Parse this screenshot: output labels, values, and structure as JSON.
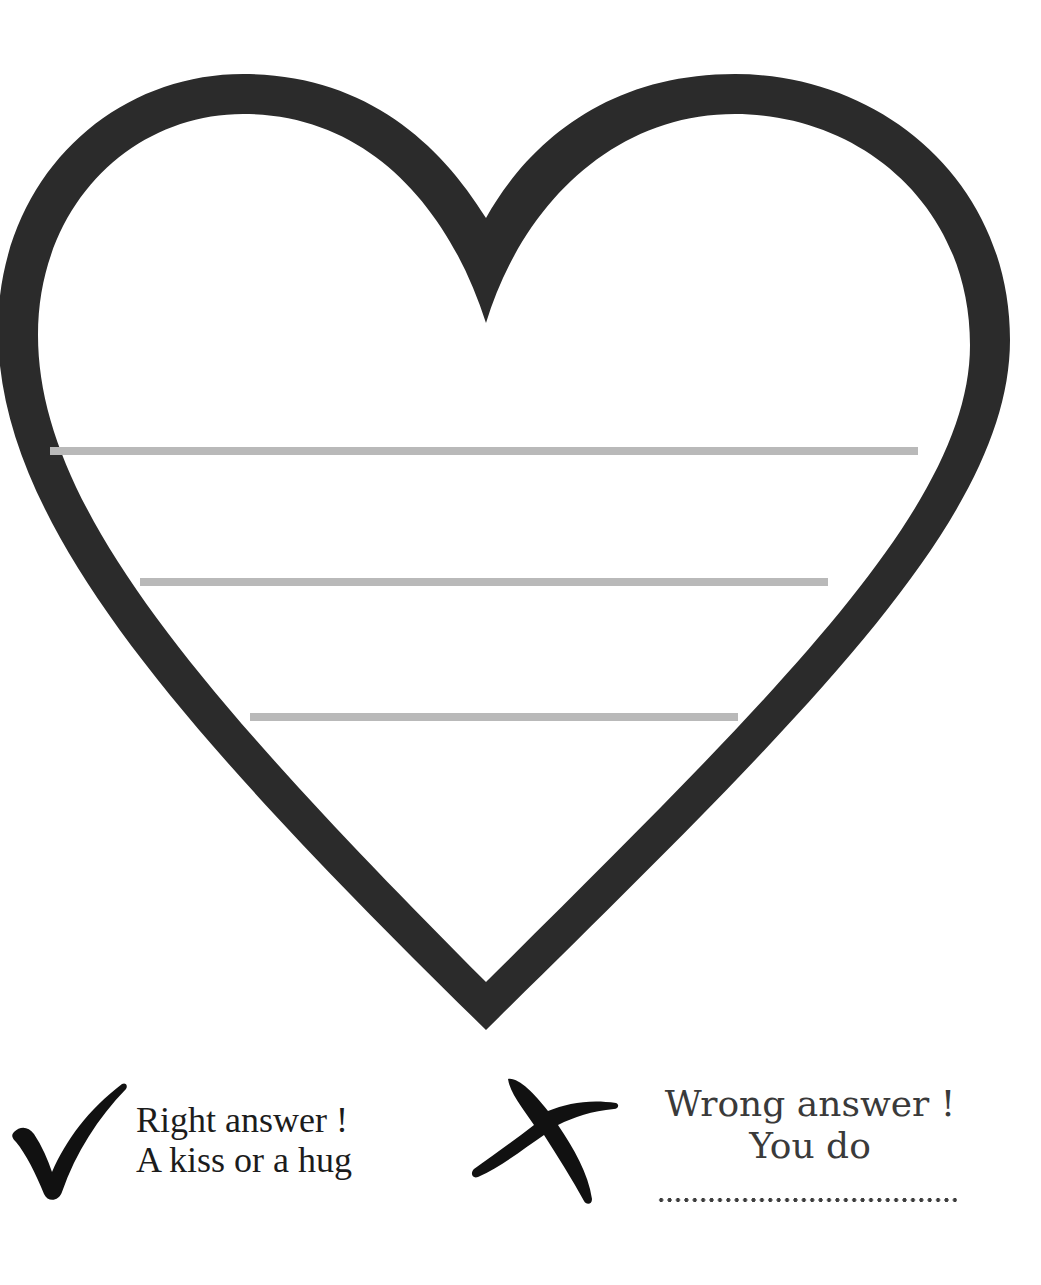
{
  "worksheet": {
    "heart": {
      "shape": "heart-outline",
      "stroke_color": "#2b2b2b",
      "stroke_width_px": 40
    },
    "writing_lines": {
      "color": "#b9b9b9",
      "count": 3
    },
    "legend": {
      "right": {
        "icon": "check-mark-icon",
        "line1": "Right answer !",
        "line2": "A kiss or a hug"
      },
      "wrong": {
        "icon": "cross-mark-icon",
        "line1": "Wrong answer !",
        "line2": "You do",
        "blank": "...................................."
      }
    }
  }
}
